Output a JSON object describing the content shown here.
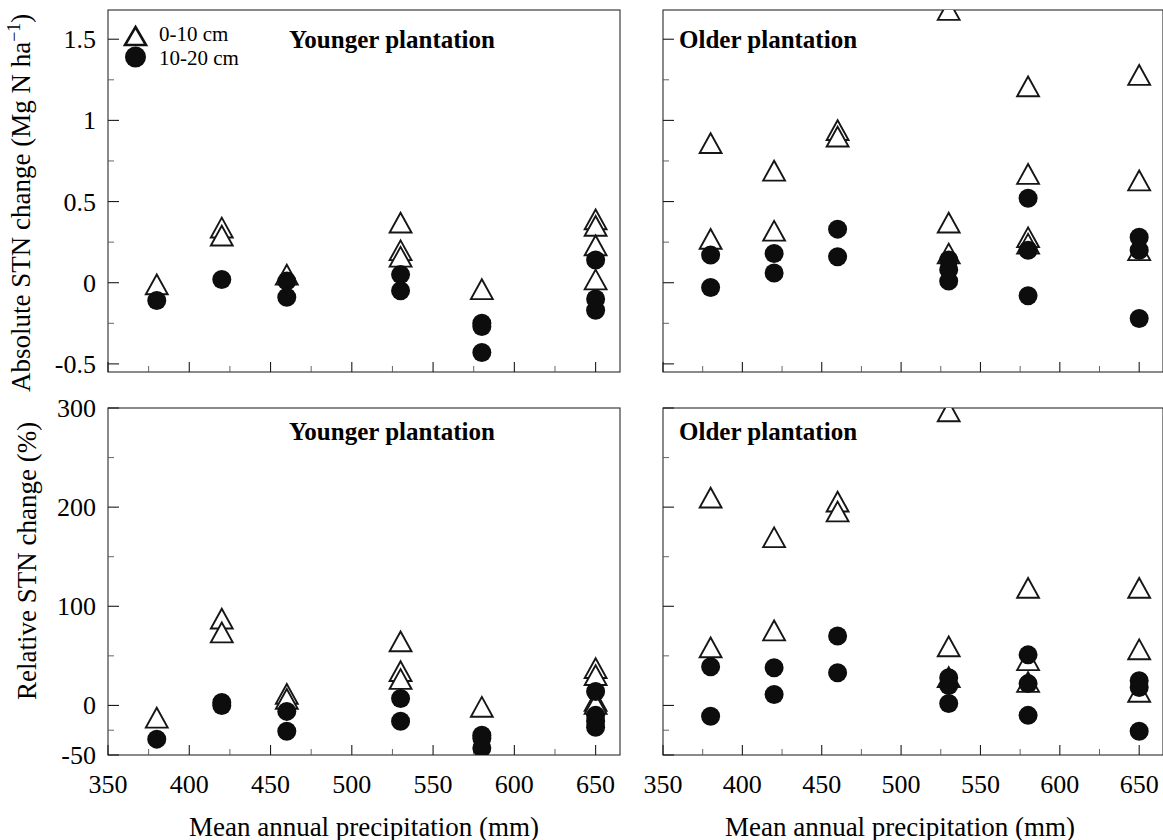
{
  "figure": {
    "xlabel": "Mean annual precipitation (mm)",
    "legend": [
      {
        "symbol": "open-triangle",
        "label": "0-10 cm"
      },
      {
        "symbol": "filled-circle",
        "label": "10-20 cm"
      }
    ],
    "x_ticks": [
      "350",
      "400",
      "450",
      "500",
      "550",
      "600",
      "650"
    ]
  },
  "panels": {
    "top_left": {
      "title": "Younger plantation",
      "ylabel_main": "Absolute STN change  (Mg N ha",
      "ylabel_sup": "−1",
      "ylabel_close": ")",
      "y_ticks": [
        "1.5",
        "1.0",
        "0.5",
        "0.0",
        "-0.5"
      ]
    },
    "top_right": {
      "title": "Older plantation"
    },
    "bottom_left": {
      "title": "Younger plantation",
      "ylabel": "Relative STN change (%)",
      "y_ticks": [
        "300",
        "200",
        "100",
        "0",
        "-50"
      ]
    },
    "bottom_right": {
      "title": "Older plantation"
    }
  },
  "chart_data": [
    {
      "id": "top-left",
      "type": "scatter",
      "title": "Younger plantation",
      "xlabel": "Mean annual precipitation (mm)",
      "ylabel": "Absolute STN change (Mg N ha-1)",
      "xlim": [
        350,
        665
      ],
      "ylim": [
        -0.55,
        1.68
      ],
      "xticks": [
        350,
        400,
        450,
        500,
        550,
        600,
        650
      ],
      "yticks": [
        1.5,
        1.0,
        0.5,
        0.0,
        -0.5
      ],
      "grid": false,
      "legend_position": "top-left",
      "series": [
        {
          "name": "0-10 cm",
          "marker": "open-triangle",
          "points": [
            {
              "x": 380,
              "y": -0.02
            },
            {
              "x": 420,
              "y": 0.33
            },
            {
              "x": 420,
              "y": 0.28
            },
            {
              "x": 460,
              "y": 0.04
            },
            {
              "x": 530,
              "y": 0.36
            },
            {
              "x": 530,
              "y": 0.19
            },
            {
              "x": 530,
              "y": 0.15
            },
            {
              "x": 580,
              "y": -0.05
            },
            {
              "x": 650,
              "y": 0.38
            },
            {
              "x": 650,
              "y": 0.34
            },
            {
              "x": 650,
              "y": 0.22
            },
            {
              "x": 650,
              "y": 0.01
            }
          ]
        },
        {
          "name": "10-20 cm",
          "marker": "filled-circle",
          "points": [
            {
              "x": 380,
              "y": -0.11
            },
            {
              "x": 420,
              "y": 0.02
            },
            {
              "x": 460,
              "y": 0.01
            },
            {
              "x": 460,
              "y": -0.09
            },
            {
              "x": 530,
              "y": 0.05
            },
            {
              "x": 530,
              "y": -0.05
            },
            {
              "x": 580,
              "y": -0.25
            },
            {
              "x": 580,
              "y": -0.27
            },
            {
              "x": 580,
              "y": -0.43
            },
            {
              "x": 650,
              "y": 0.14
            },
            {
              "x": 650,
              "y": -0.1
            },
            {
              "x": 650,
              "y": -0.17
            }
          ]
        }
      ]
    },
    {
      "id": "top-right",
      "type": "scatter",
      "title": "Older plantation",
      "xlabel": "Mean annual precipitation (mm)",
      "ylabel": "Absolute STN change (Mg N ha-1)",
      "xlim": [
        350,
        665
      ],
      "ylim": [
        -0.55,
        1.68
      ],
      "xticks": [
        350,
        400,
        450,
        500,
        550,
        600,
        650
      ],
      "yticks": [
        1.5,
        1.0,
        0.5,
        0.0,
        -0.5
      ],
      "grid": false,
      "legend_position": "none",
      "series": [
        {
          "name": "0-10 cm",
          "marker": "open-triangle",
          "points": [
            {
              "x": 380,
              "y": 0.85
            },
            {
              "x": 380,
              "y": 0.26
            },
            {
              "x": 420,
              "y": 0.68
            },
            {
              "x": 420,
              "y": 0.31
            },
            {
              "x": 460,
              "y": 0.93
            },
            {
              "x": 460,
              "y": 0.89
            },
            {
              "x": 530,
              "y": 1.67
            },
            {
              "x": 530,
              "y": 0.36
            },
            {
              "x": 530,
              "y": 0.17
            },
            {
              "x": 580,
              "y": 1.2
            },
            {
              "x": 580,
              "y": 0.66
            },
            {
              "x": 580,
              "y": 0.27
            },
            {
              "x": 580,
              "y": 0.23
            },
            {
              "x": 650,
              "y": 1.27
            },
            {
              "x": 650,
              "y": 0.62
            },
            {
              "x": 650,
              "y": 0.19
            }
          ]
        },
        {
          "name": "10-20 cm",
          "marker": "filled-circle",
          "points": [
            {
              "x": 380,
              "y": 0.17
            },
            {
              "x": 380,
              "y": -0.03
            },
            {
              "x": 420,
              "y": 0.18
            },
            {
              "x": 420,
              "y": 0.06
            },
            {
              "x": 460,
              "y": 0.33
            },
            {
              "x": 460,
              "y": 0.16
            },
            {
              "x": 530,
              "y": 0.14
            },
            {
              "x": 530,
              "y": 0.08
            },
            {
              "x": 530,
              "y": 0.01
            },
            {
              "x": 580,
              "y": 0.52
            },
            {
              "x": 580,
              "y": 0.2
            },
            {
              "x": 580,
              "y": -0.08
            },
            {
              "x": 650,
              "y": 0.28
            },
            {
              "x": 650,
              "y": 0.2
            },
            {
              "x": 650,
              "y": -0.22
            }
          ]
        }
      ]
    },
    {
      "id": "bottom-left",
      "type": "scatter",
      "title": "Younger plantation",
      "xlabel": "Mean annual precipitation (mm)",
      "ylabel": "Relative STN change (%)",
      "xlim": [
        350,
        665
      ],
      "ylim": [
        -50,
        300
      ],
      "xticks": [
        350,
        400,
        450,
        500,
        550,
        600,
        650
      ],
      "yticks": [
        300,
        200,
        100,
        0,
        -50
      ],
      "grid": false,
      "legend_position": "none",
      "series": [
        {
          "name": "0-10 cm",
          "marker": "open-triangle",
          "points": [
            {
              "x": 380,
              "y": -14
            },
            {
              "x": 420,
              "y": 86
            },
            {
              "x": 420,
              "y": 72
            },
            {
              "x": 460,
              "y": 10
            },
            {
              "x": 460,
              "y": 5
            },
            {
              "x": 530,
              "y": 63
            },
            {
              "x": 530,
              "y": 33
            },
            {
              "x": 530,
              "y": 25
            },
            {
              "x": 580,
              "y": -3
            },
            {
              "x": 650,
              "y": 36
            },
            {
              "x": 650,
              "y": 29
            },
            {
              "x": 650,
              "y": 3
            },
            {
              "x": 650,
              "y": 0
            }
          ]
        },
        {
          "name": "10-20 cm",
          "marker": "filled-circle",
          "points": [
            {
              "x": 380,
              "y": -34
            },
            {
              "x": 420,
              "y": 3
            },
            {
              "x": 420,
              "y": 0
            },
            {
              "x": 460,
              "y": -6
            },
            {
              "x": 460,
              "y": -26
            },
            {
              "x": 530,
              "y": 7
            },
            {
              "x": 530,
              "y": -16
            },
            {
              "x": 580,
              "y": -30
            },
            {
              "x": 580,
              "y": -33
            },
            {
              "x": 580,
              "y": -43
            },
            {
              "x": 650,
              "y": 14
            },
            {
              "x": 650,
              "y": -10
            },
            {
              "x": 650,
              "y": -16
            },
            {
              "x": 650,
              "y": -22
            }
          ]
        }
      ]
    },
    {
      "id": "bottom-right",
      "type": "scatter",
      "title": "Older plantation",
      "xlabel": "Mean annual precipitation (mm)",
      "ylabel": "Relative STN change (%)",
      "xlim": [
        350,
        665
      ],
      "ylim": [
        -50,
        300
      ],
      "xticks": [
        350,
        400,
        450,
        500,
        550,
        600,
        650
      ],
      "yticks": [
        300,
        200,
        100,
        0,
        -50
      ],
      "grid": false,
      "legend_position": "none",
      "series": [
        {
          "name": "0-10 cm",
          "marker": "open-triangle",
          "points": [
            {
              "x": 380,
              "y": 208
            },
            {
              "x": 380,
              "y": 57
            },
            {
              "x": 420,
              "y": 168
            },
            {
              "x": 420,
              "y": 74
            },
            {
              "x": 460,
              "y": 204
            },
            {
              "x": 460,
              "y": 194
            },
            {
              "x": 530,
              "y": 295
            },
            {
              "x": 530,
              "y": 58
            },
            {
              "x": 530,
              "y": 27
            },
            {
              "x": 580,
              "y": 117
            },
            {
              "x": 580,
              "y": 44
            },
            {
              "x": 580,
              "y": 22
            },
            {
              "x": 650,
              "y": 117
            },
            {
              "x": 650,
              "y": 55
            },
            {
              "x": 650,
              "y": 12
            }
          ]
        },
        {
          "name": "10-20 cm",
          "marker": "filled-circle",
          "points": [
            {
              "x": 380,
              "y": 39
            },
            {
              "x": 380,
              "y": -11
            },
            {
              "x": 420,
              "y": 38
            },
            {
              "x": 420,
              "y": 11
            },
            {
              "x": 460,
              "y": 70
            },
            {
              "x": 460,
              "y": 33
            },
            {
              "x": 530,
              "y": 28
            },
            {
              "x": 530,
              "y": 20
            },
            {
              "x": 530,
              "y": 2
            },
            {
              "x": 580,
              "y": 51
            },
            {
              "x": 580,
              "y": 22
            },
            {
              "x": 580,
              "y": -10
            },
            {
              "x": 650,
              "y": 25
            },
            {
              "x": 650,
              "y": 18
            },
            {
              "x": 650,
              "y": -26
            }
          ]
        }
      ]
    }
  ]
}
